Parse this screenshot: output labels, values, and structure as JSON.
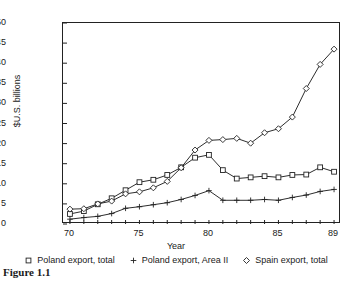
{
  "figure": {
    "caption": "Figure 1.1"
  },
  "chart_data": {
    "type": "line",
    "title": "",
    "xlabel": "Year",
    "ylabel": "$U.S. billions",
    "xlim": [
      69.5,
      89.5
    ],
    "ylim": [
      0,
      50
    ],
    "xticks": [
      70,
      75,
      80,
      85,
      89
    ],
    "xtick_labels": [
      "70",
      "75",
      "80",
      "85",
      "89"
    ],
    "yticks": [
      0,
      5,
      10,
      15,
      20,
      25,
      30,
      35,
      40,
      45,
      50
    ],
    "ytick_labels": [
      "0",
      "5",
      "10",
      "15",
      "20",
      "25",
      "30",
      "35",
      "40",
      "45",
      "50"
    ],
    "grid": false,
    "legend_position": "below",
    "x": [
      70,
      71,
      72,
      73,
      74,
      75,
      76,
      77,
      78,
      79,
      80,
      81,
      82,
      83,
      84,
      85,
      86,
      87,
      88,
      89
    ],
    "series": [
      {
        "name": "Poland export, total",
        "marker": "square",
        "color": "#222222",
        "values": [
          2.5,
          3.2,
          4.9,
          6.4,
          8.4,
          10.4,
          11.0,
          12.2,
          14.1,
          16.5,
          17.2,
          13.4,
          11.3,
          11.6,
          11.9,
          11.6,
          12.2,
          12.3,
          14.1,
          13.0
        ]
      },
      {
        "name": "Poland export, Area II",
        "marker": "plus",
        "color": "#222222",
        "values": [
          1.2,
          1.6,
          1.9,
          2.6,
          3.9,
          4.3,
          4.8,
          5.3,
          6.1,
          7.1,
          8.3,
          5.9,
          5.9,
          5.9,
          6.1,
          5.9,
          6.6,
          7.2,
          8.1,
          8.6
        ]
      },
      {
        "name": "Spain export, total",
        "marker": "diamond",
        "color": "#222222",
        "values": [
          3.7,
          3.8,
          5.0,
          5.7,
          7.5,
          8.0,
          9.0,
          10.6,
          14.0,
          18.4,
          20.8,
          21.0,
          21.3,
          20.1,
          22.7,
          23.7,
          26.6,
          33.7,
          39.7,
          43.5
        ]
      }
    ]
  }
}
